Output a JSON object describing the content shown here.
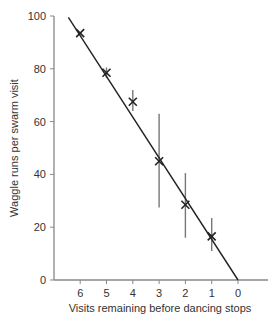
{
  "chart_data": {
    "type": "scatter",
    "title": "",
    "xlabel": "Visits remaining before dancing stops",
    "ylabel": "Waggle runs per swarm visit",
    "x_ticks": [
      "6",
      "5",
      "4",
      "3",
      "2",
      "1",
      "0"
    ],
    "y_ticks": [
      "0",
      "20",
      "40",
      "60",
      "80",
      "100"
    ],
    "xlim": [
      7,
      -1.1
    ],
    "ylim": [
      0,
      100
    ],
    "grid": false,
    "legend": null,
    "points": [
      {
        "x": 6,
        "y": 93.5,
        "err_low": 93.5,
        "err_high": 93.5
      },
      {
        "x": 5,
        "y": 78.5,
        "err_low": 76.5,
        "err_high": 80.5
      },
      {
        "x": 4,
        "y": 67.5,
        "err_low": 64,
        "err_high": 72
      },
      {
        "x": 3,
        "y": 45,
        "err_low": 27.5,
        "err_high": 63
      },
      {
        "x": 2,
        "y": 28.5,
        "err_low": 16,
        "err_high": 40.5
      },
      {
        "x": 1,
        "y": 16.5,
        "err_low": 11,
        "err_high": 23.5
      }
    ],
    "fit_line": {
      "x1": 6.45,
      "y1": 99.5,
      "x2": 0,
      "y2": 0
    },
    "marker": "x",
    "colors": {
      "axis": "#888888",
      "line": "#222222",
      "marker": "#222222",
      "errorbar": "#777777"
    }
  }
}
